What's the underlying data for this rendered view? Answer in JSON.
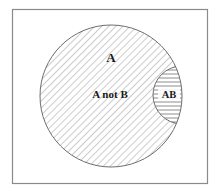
{
  "diagram": {
    "type": "venn",
    "universe": {
      "x": 12,
      "y": 9,
      "width": 195,
      "height": 174,
      "stroke": "#8a8a8a"
    },
    "circle_a": {
      "cx": 111,
      "cy": 96,
      "r": 71,
      "stroke": "#6e6e6e",
      "hatch": "diagonal"
    },
    "circle_b": {
      "cx": 182,
      "cy": 95,
      "r": 29,
      "stroke": "#6e6e6e"
    },
    "intersection": {
      "hatch": "horizontal"
    },
    "labels": {
      "set_a": "A",
      "a_not_b": "A not B",
      "ab": "AB"
    },
    "colors": {
      "hatch": "#9a9a9a",
      "outline": "#6e6e6e",
      "text": "#1a1a1a",
      "background": "#ffffff"
    }
  }
}
